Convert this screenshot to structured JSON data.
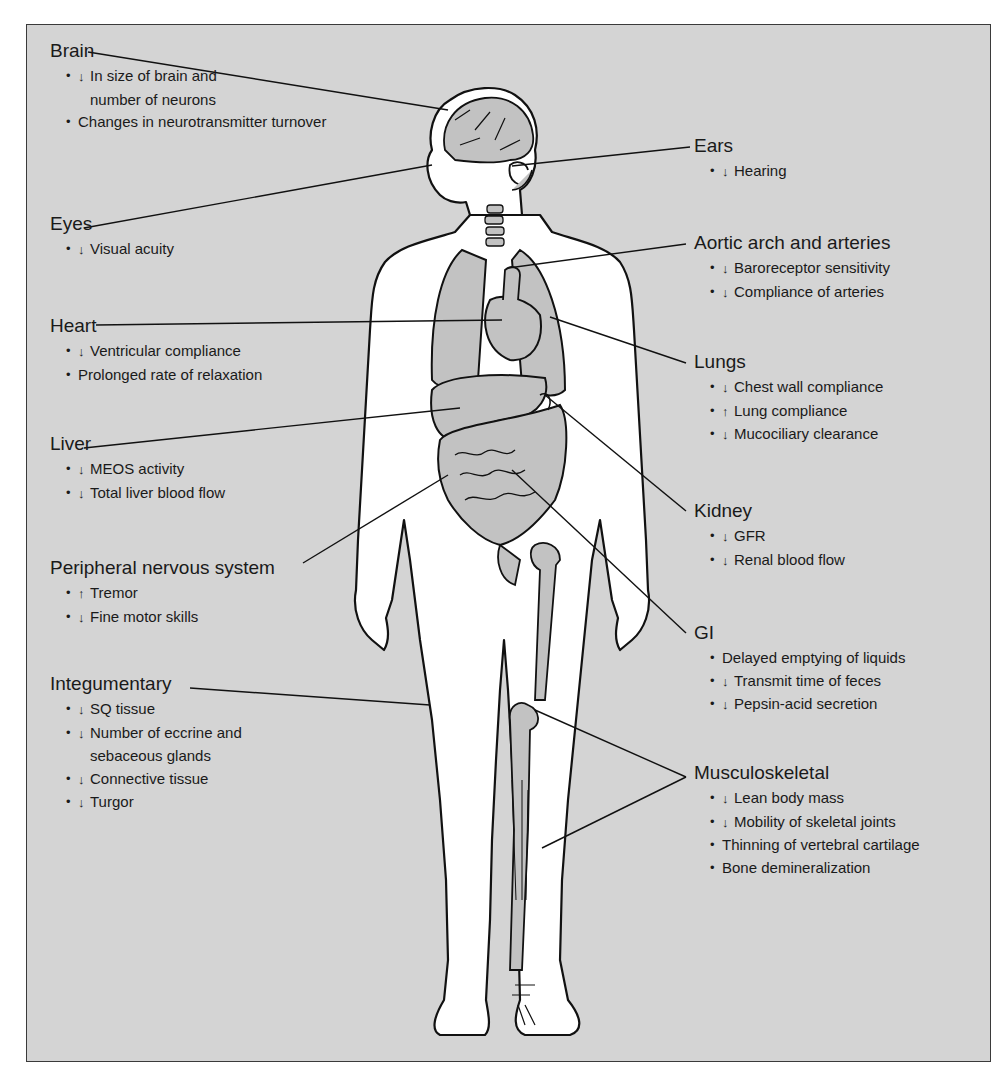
{
  "colors": {
    "background": "#d4d4d4",
    "border": "#3a3a3a",
    "organ_fill": "#c2c2c2",
    "skin": "#ffffff",
    "ink": "#1a1a1a"
  },
  "icons": {
    "decrease": "arrow-down-icon",
    "increase": "arrow-up-icon"
  },
  "left": [
    {
      "id": "brain",
      "heading": "Brain",
      "items": [
        {
          "arrow": "↓",
          "text": "In size of brain and",
          "cont": "number of neurons"
        },
        {
          "arrow": "",
          "text": "Changes in neurotransmitter turnover"
        }
      ]
    },
    {
      "id": "eyes",
      "heading": "Eyes",
      "items": [
        {
          "arrow": "↓",
          "text": "Visual acuity"
        }
      ]
    },
    {
      "id": "heart",
      "heading": "Heart",
      "items": [
        {
          "arrow": "↓",
          "text": "Ventricular compliance"
        },
        {
          "arrow": "",
          "text": "Prolonged rate of relaxation"
        }
      ]
    },
    {
      "id": "liver",
      "heading": "Liver",
      "items": [
        {
          "arrow": "↓",
          "text": "MEOS activity"
        },
        {
          "arrow": "↓",
          "text": "Total liver blood flow"
        }
      ]
    },
    {
      "id": "pns",
      "heading": "Peripheral nervous system",
      "items": [
        {
          "arrow": "↑",
          "text": "Tremor"
        },
        {
          "arrow": "↓",
          "text": "Fine motor skills"
        }
      ]
    },
    {
      "id": "integumentary",
      "heading": "Integumentary",
      "items": [
        {
          "arrow": "↓",
          "text": "SQ tissue"
        },
        {
          "arrow": "↓",
          "text": "Number of eccrine and",
          "cont": "sebaceous glands"
        },
        {
          "arrow": "↓",
          "text": "Connective tissue"
        },
        {
          "arrow": "↓",
          "text": "Turgor"
        }
      ]
    }
  ],
  "right": [
    {
      "id": "ears",
      "heading": "Ears",
      "items": [
        {
          "arrow": "↓",
          "text": "Hearing"
        }
      ]
    },
    {
      "id": "aortic",
      "heading": "Aortic arch and arteries",
      "items": [
        {
          "arrow": "↓",
          "text": "Baroreceptor sensitivity"
        },
        {
          "arrow": "↓",
          "text": "Compliance of arteries"
        }
      ]
    },
    {
      "id": "lungs",
      "heading": "Lungs",
      "items": [
        {
          "arrow": "↓",
          "text": "Chest wall compliance"
        },
        {
          "arrow": "↑",
          "text": "Lung compliance"
        },
        {
          "arrow": "↓",
          "text": "Mucociliary clearance"
        }
      ]
    },
    {
      "id": "kidney",
      "heading": "Kidney",
      "items": [
        {
          "arrow": "↓",
          "text": "GFR"
        },
        {
          "arrow": "↓",
          "text": "Renal blood flow"
        }
      ]
    },
    {
      "id": "gi",
      "heading": "GI",
      "items": [
        {
          "arrow": "",
          "text": "Delayed emptying of liquids"
        },
        {
          "arrow": "↓",
          "text": "Transmit time of feces"
        },
        {
          "arrow": "↓",
          "text": "Pepsin-acid secretion"
        }
      ]
    },
    {
      "id": "musculoskeletal",
      "heading": "Musculoskeletal",
      "items": [
        {
          "arrow": "↓",
          "text": "Lean body mass"
        },
        {
          "arrow": "↓",
          "text": "Mobility of skeletal joints"
        },
        {
          "arrow": "",
          "text": "Thinning of vertebral cartilage"
        },
        {
          "arrow": "",
          "text": "Bone demineralization"
        }
      ]
    }
  ]
}
